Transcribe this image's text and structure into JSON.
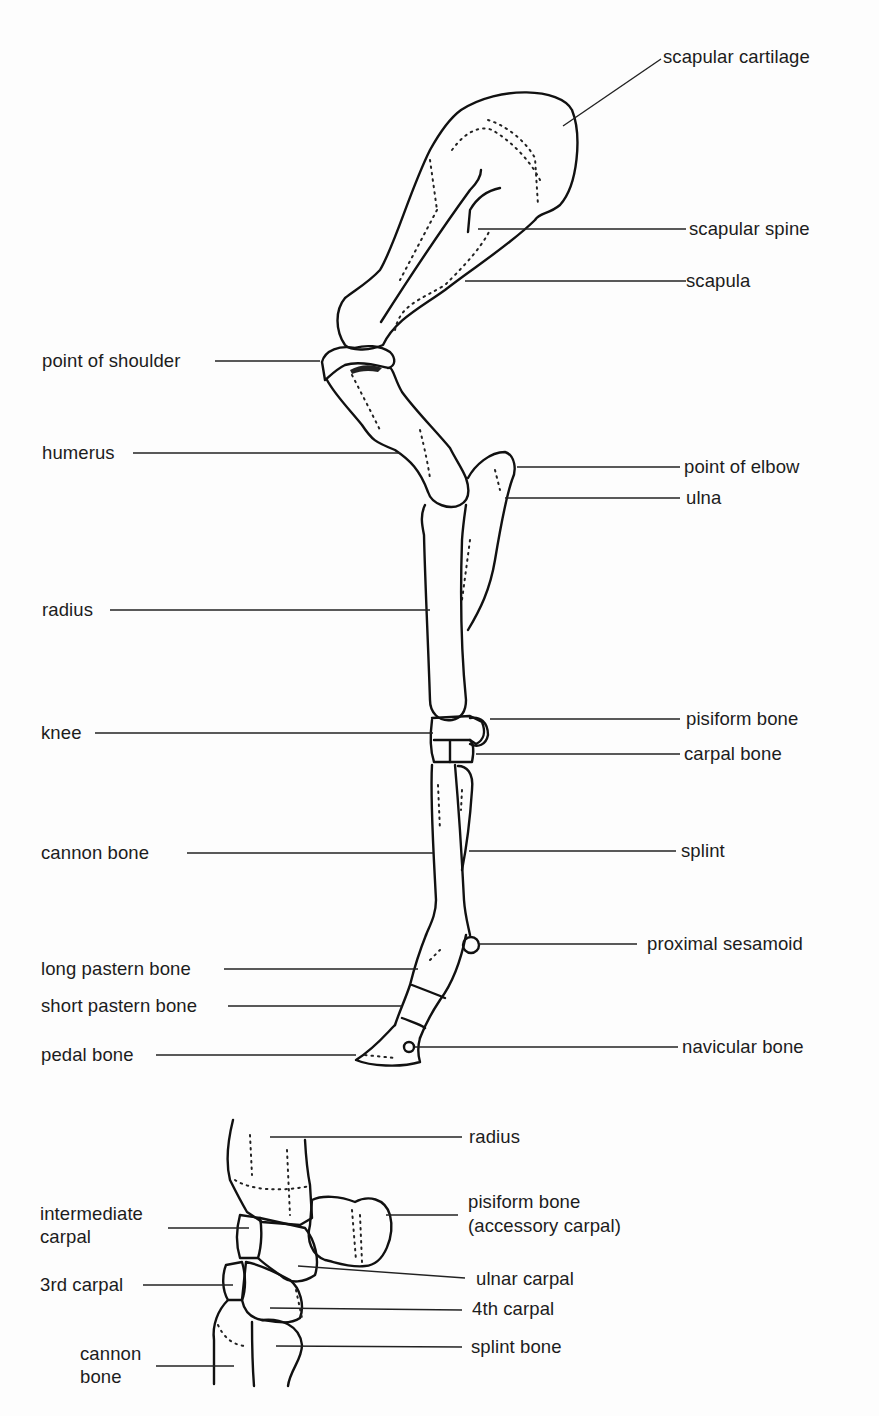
{
  "figure": {
    "type": "anatomical-diagram",
    "main_labels_right": [
      {
        "id": "scapular-cartilage",
        "text": "scapular cartilage"
      },
      {
        "id": "scapular-spine",
        "text": "scapular spine"
      },
      {
        "id": "scapula",
        "text": "scapula"
      },
      {
        "id": "point-of-elbow",
        "text": "point of elbow"
      },
      {
        "id": "ulna",
        "text": "ulna"
      },
      {
        "id": "pisiform-bone",
        "text": "pisiform bone"
      },
      {
        "id": "carpal-bone",
        "text": "carpal bone"
      },
      {
        "id": "splint",
        "text": "splint"
      },
      {
        "id": "proximal-sesamoid",
        "text": "proximal sesamoid"
      },
      {
        "id": "navicular-bone",
        "text": "navicular bone"
      }
    ],
    "main_labels_left": [
      {
        "id": "point-of-shoulder",
        "text": "point of shoulder"
      },
      {
        "id": "humerus",
        "text": "humerus"
      },
      {
        "id": "radius",
        "text": "radius"
      },
      {
        "id": "knee",
        "text": "knee"
      },
      {
        "id": "cannon-bone",
        "text": "cannon bone"
      },
      {
        "id": "long-pastern-bone",
        "text": "long pastern bone"
      },
      {
        "id": "short-pastern-bone",
        "text": "short pastern bone"
      },
      {
        "id": "pedal-bone",
        "text": "pedal bone"
      }
    ],
    "detail_labels_right": [
      {
        "id": "detail-radius",
        "text": "radius"
      },
      {
        "id": "detail-pisiform",
        "line1": "pisiform bone",
        "line2": "(accessory carpal)"
      },
      {
        "id": "detail-ulnar-carpal",
        "text": "ulnar carpal"
      },
      {
        "id": "detail-4th-carpal",
        "text": "4th carpal"
      },
      {
        "id": "detail-splint-bone",
        "text": "splint bone"
      }
    ],
    "detail_labels_left": [
      {
        "id": "detail-intermediate-carpal",
        "line1": "intermediate",
        "line2": "carpal"
      },
      {
        "id": "detail-3rd-carpal",
        "text": "3rd carpal"
      },
      {
        "id": "detail-cannon-bone",
        "line1": "cannon",
        "line2": "bone"
      }
    ]
  }
}
